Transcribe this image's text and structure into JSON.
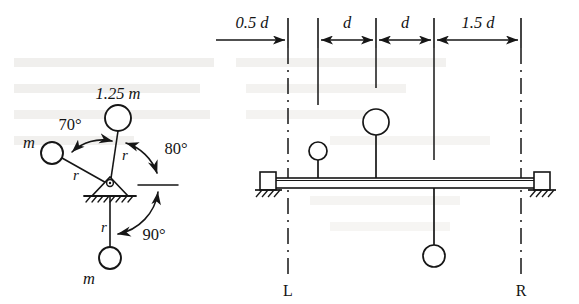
{
  "figure": {
    "line_color": "#161616",
    "ghost_text_color": "#d8d6d2"
  },
  "left_diagram": {
    "name": "end-view-mass-arrangement",
    "pivot": {
      "cx": 110,
      "cy": 185
    },
    "masses": [
      {
        "id": "top",
        "label": "1.25 m",
        "radius_label": "r",
        "cx": 118,
        "cy": 118,
        "r": 13,
        "label_x": 118,
        "label_y": 96
      },
      {
        "id": "left",
        "label": "m",
        "radius_label": "r",
        "cx": 52,
        "cy": 153,
        "r": 11,
        "label_x": 28,
        "label_y": 144
      },
      {
        "id": "bottom",
        "label": "m",
        "radius_label": "r",
        "cx": 110,
        "cy": 258,
        "r": 11,
        "label_x": 88,
        "label_y": 281
      }
    ],
    "radius_labels": [
      {
        "text": "r",
        "x": 120,
        "y": 155
      },
      {
        "text": "r",
        "x": 74,
        "y": 175
      },
      {
        "text": "r",
        "x": 102,
        "y": 228
      }
    ],
    "angles": [
      {
        "text": "70°",
        "x": 70,
        "y": 124
      },
      {
        "text": "80°",
        "x": 176,
        "y": 148
      },
      {
        "text": "90°",
        "x": 152,
        "y": 234
      }
    ]
  },
  "right_diagram": {
    "name": "side-view-shaft-elevation",
    "dimensions": [
      {
        "text": "0.5 d",
        "x": 252,
        "y": 27
      },
      {
        "text": "d",
        "x": 347,
        "y": 27
      },
      {
        "text": "d",
        "x": 404,
        "y": 27
      },
      {
        "text": "d",
        "x": 484,
        "y": 27,
        "prefix": "1.5 "
      }
    ],
    "dimension_labels": [
      "0.5 d",
      "d",
      "d",
      "1.5 d"
    ],
    "tick_positions": [
      288,
      318,
      376,
      434,
      521
    ],
    "shaft": {
      "x1": 270,
      "x2": 540,
      "top": 178,
      "bottom": 188
    },
    "supports": [
      {
        "id": "left-bearing",
        "x": 270,
        "y": 183
      },
      {
        "id": "right-bearing",
        "x": 540,
        "y": 183
      }
    ],
    "plane_labels": [
      {
        "text": "L",
        "x": 288,
        "y": 292
      },
      {
        "text": "R",
        "x": 521,
        "y": 292
      }
    ],
    "masses": [
      {
        "id": "mass-up-small",
        "cx": 318,
        "cy": 151,
        "r": 9,
        "stem_to": 178,
        "side": "up"
      },
      {
        "id": "mass-up-large",
        "cx": 376,
        "cy": 122,
        "r": 13,
        "stem_to": 178,
        "side": "up"
      },
      {
        "id": "mass-down",
        "cx": 434,
        "cy": 256,
        "r": 11,
        "stem_to": 188,
        "side": "down"
      }
    ]
  },
  "background_text": [
    {
      "text": "— — — —  — — — — —",
      "x": 14,
      "y": 68
    },
    {
      "text": "— — —  — — — —",
      "x": 14,
      "y": 92
    },
    {
      "text": "— — — — — —",
      "x": 14,
      "y": 116
    },
    {
      "text": "— — — —",
      "x": 14,
      "y": 140
    }
  ]
}
